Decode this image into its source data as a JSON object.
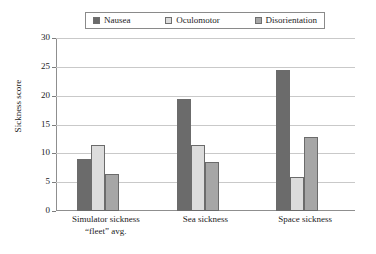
{
  "chart_data": {
    "type": "bar",
    "title": "",
    "xlabel": "",
    "ylabel": "Sickness score",
    "ylim": [
      0,
      30
    ],
    "ytick_step": 5,
    "yticks": [
      "30",
      "25",
      "20",
      "15",
      "10",
      "5",
      "0"
    ],
    "grid": true,
    "legend_position": "top-center",
    "categories": [
      "Simulator sickness\n“fleet” avg.",
      "Sea sickness",
      "Space sickness"
    ],
    "category_lines": [
      [
        "Simulator sickness",
        "“fleet” avg."
      ],
      [
        "Sea sickness",
        ""
      ],
      [
        "Space sickness",
        ""
      ]
    ],
    "series": [
      {
        "name": "Nausea",
        "color": "#6b6b6b",
        "values": [
          9.0,
          19.5,
          24.5
        ]
      },
      {
        "name": "Oculomotor",
        "color": "#dcdcdc",
        "values": [
          11.5,
          11.5,
          5.9
        ]
      },
      {
        "name": "Disorientation",
        "color": "#a6a6a6",
        "values": [
          6.4,
          8.5,
          12.9
        ]
      }
    ]
  },
  "legend": {
    "entries": [
      {
        "label": "Nausea",
        "swatch": "legend-swatch-nausea"
      },
      {
        "label": "Oculomotor",
        "swatch": "legend-swatch-oculomotor"
      },
      {
        "label": "Disorientation",
        "swatch": "legend-swatch-disorientation"
      }
    ]
  },
  "axes": {
    "y_title": "Sickness score"
  }
}
